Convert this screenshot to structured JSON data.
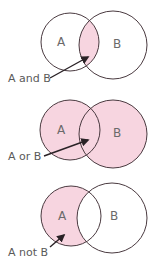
{
  "colors": {
    "fill": "#F7D5E0",
    "stroke": "#4a3a40",
    "background": "#ffffff"
  },
  "diagrams": [
    {
      "operation": "intersection",
      "circle_a_label": "A",
      "circle_b_label": "B",
      "caption": "A and B"
    },
    {
      "operation": "union",
      "circle_a_label": "A",
      "circle_b_label": "B",
      "caption": "A or B"
    },
    {
      "operation": "difference",
      "circle_a_label": "A",
      "circle_b_label": "B",
      "caption": "A not B"
    }
  ]
}
